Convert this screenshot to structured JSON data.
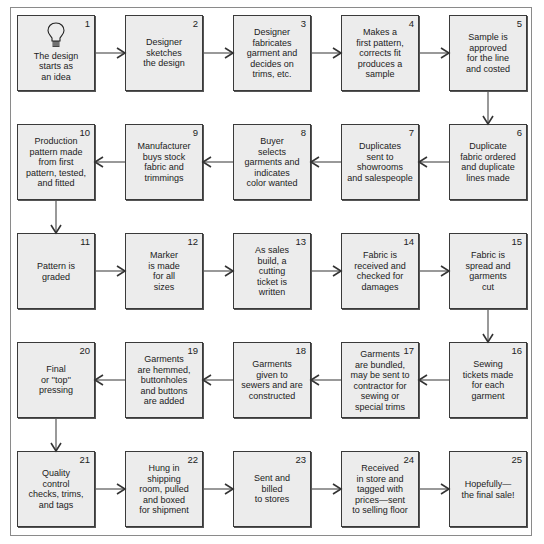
{
  "diagram": {
    "type": "flowchart",
    "layout": "serpentine 5x5",
    "colors": {
      "box_fill": "#ececec",
      "box_border": "#3a3a3a",
      "line": "#555555",
      "text": "#222222"
    },
    "steps": [
      {
        "num": "1",
        "text": "The design\nstarts as\nan idea",
        "icon": "lightbulb-icon"
      },
      {
        "num": "2",
        "text": "Designer\nsketches\nthe design"
      },
      {
        "num": "3",
        "text": "Designer\nfabricates\ngarment and\ndecides on\ntrims, etc."
      },
      {
        "num": "4",
        "text": "Makes a\nfirst pattern,\ncorrects fit\nproduces a\nsample"
      },
      {
        "num": "5",
        "text": "Sample is\napproved\nfor the line\nand costed"
      },
      {
        "num": "6",
        "text": "Duplicate\nfabric ordered\nand duplicate\nlines made"
      },
      {
        "num": "7",
        "text": "Duplicates\nsent to\nshowrooms\nand salespeople"
      },
      {
        "num": "8",
        "text": "Buyer\nselects\ngarments and\nindicates\ncolor wanted"
      },
      {
        "num": "9",
        "text": "Manufacturer\nbuys stock\nfabric and\ntrimmings"
      },
      {
        "num": "10",
        "text": "Production\npattern made\nfrom first\npattern, tested,\nand fitted"
      },
      {
        "num": "11",
        "text": "Pattern is\ngraded"
      },
      {
        "num": "12",
        "text": "Marker\nis made\nfor all\nsizes"
      },
      {
        "num": "13",
        "text": "As sales\nbuild, a\ncutting\nticket is\nwritten"
      },
      {
        "num": "14",
        "text": "Fabric is\nreceived and\nchecked for\ndamages"
      },
      {
        "num": "15",
        "text": "Fabric is\nspread and\ngarments\ncut"
      },
      {
        "num": "16",
        "text": "Sewing\ntickets made\nfor each\ngarment"
      },
      {
        "num": "17",
        "text": "Garments\nare bundled,\nmay be sent to\ncontractor for\nsewing or\nspecial trims"
      },
      {
        "num": "18",
        "text": "Garments\ngiven to\nsewers and are\nconstructed"
      },
      {
        "num": "19",
        "text": "Garments\nare hemmed,\nbuttonholes\nand buttons\nare added"
      },
      {
        "num": "20",
        "text": "Final\nor ''top''\npressing"
      },
      {
        "num": "21",
        "text": "Quality\ncontrol\nchecks, trims,\nand tags"
      },
      {
        "num": "22",
        "text": "Hung in\nshipping\nroom, pulled\nand boxed\nfor shipment"
      },
      {
        "num": "23",
        "text": "Sent and\nbilled\nto stores"
      },
      {
        "num": "24",
        "text": "Received\nin store and\ntagged with\nprices—sent\nto selling floor"
      },
      {
        "num": "25",
        "text": "Hopefully—\nthe final sale!"
      }
    ],
    "edges": [
      [
        "1",
        "2"
      ],
      [
        "2",
        "3"
      ],
      [
        "3",
        "4"
      ],
      [
        "4",
        "5"
      ],
      [
        "5",
        "6"
      ],
      [
        "6",
        "7"
      ],
      [
        "7",
        "8"
      ],
      [
        "8",
        "9"
      ],
      [
        "9",
        "10"
      ],
      [
        "10",
        "11"
      ],
      [
        "11",
        "12"
      ],
      [
        "12",
        "13"
      ],
      [
        "13",
        "14"
      ],
      [
        "14",
        "15"
      ],
      [
        "15",
        "16"
      ],
      [
        "16",
        "17"
      ],
      [
        "17",
        "18"
      ],
      [
        "18",
        "19"
      ],
      [
        "19",
        "20"
      ],
      [
        "20",
        "21"
      ],
      [
        "21",
        "22"
      ],
      [
        "22",
        "23"
      ],
      [
        "23",
        "24"
      ],
      [
        "24",
        "25"
      ]
    ]
  }
}
